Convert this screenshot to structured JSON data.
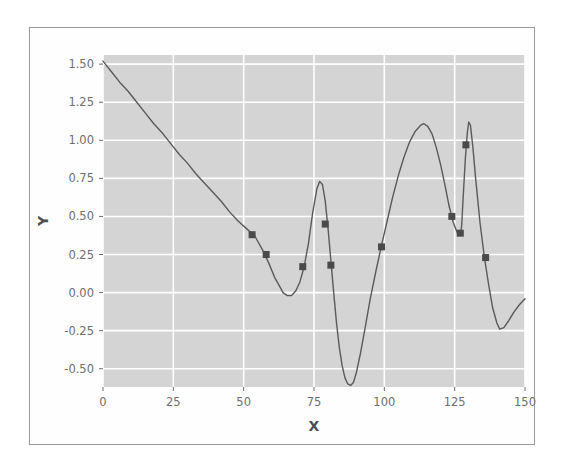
{
  "figure": {
    "background_color": "#ffffff",
    "frame_color": "#9a9a9a",
    "plot_background_color": "#d4d4d4",
    "grid_color": "#ffffff",
    "line_color": "#5a5a5a",
    "marker_color": "#4a4a4a",
    "tick_label_color": "#6e6e6e",
    "axis_title_color": "#4d4d4d"
  },
  "chart_data": {
    "type": "line",
    "title": "",
    "xlabel": "X",
    "ylabel": "Y",
    "xlim": [
      0,
      150
    ],
    "ylim": [
      -0.62,
      1.56
    ],
    "grid": true,
    "legend": null,
    "xticks": [
      0,
      25,
      50,
      75,
      100,
      125,
      150
    ],
    "xticklabels": [
      "0",
      "25",
      "50",
      "75",
      "100",
      "125",
      "150"
    ],
    "yticks": [
      -0.5,
      -0.25,
      0.0,
      0.25,
      0.5,
      0.75,
      1.0,
      1.25,
      1.5
    ],
    "yticklabels": [
      "-0.50",
      "-0.25",
      "0.00",
      "0.25",
      "0.50",
      "0.75",
      "1.00",
      "1.25",
      "1.50"
    ],
    "series": [
      {
        "name": "curve",
        "style": "line",
        "color": "#5a5a5a",
        "linewidth": 1.4,
        "x": [
          0,
          3,
          6,
          9,
          12,
          15,
          18,
          21,
          24,
          27,
          30,
          33,
          36,
          39,
          42,
          45,
          48,
          51,
          54,
          57,
          59,
          61,
          62.5,
          64,
          65.5,
          67,
          68.5,
          70,
          71.5,
          73,
          74.5,
          76,
          77,
          78,
          79,
          80,
          81,
          82,
          83,
          84,
          85,
          86,
          87,
          88,
          89,
          90,
          91.5,
          93,
          95,
          97,
          99,
          101,
          103,
          105,
          107,
          109,
          111,
          113,
          114,
          115.5,
          117,
          118.5,
          120,
          121.5,
          123,
          124.5,
          126,
          127,
          127.5,
          128,
          128.8,
          129.5,
          130,
          130.6,
          131.5,
          132.5,
          134,
          135.5,
          137,
          138.5,
          140,
          141,
          142.5,
          144,
          146,
          148,
          150
        ],
        "y": [
          1.52,
          1.45,
          1.38,
          1.32,
          1.25,
          1.18,
          1.11,
          1.05,
          0.98,
          0.91,
          0.85,
          0.78,
          0.72,
          0.66,
          0.6,
          0.53,
          0.47,
          0.42,
          0.37,
          0.27,
          0.19,
          0.1,
          0.05,
          0.0,
          -0.02,
          -0.02,
          0.01,
          0.07,
          0.17,
          0.32,
          0.52,
          0.68,
          0.73,
          0.71,
          0.6,
          0.42,
          0.21,
          0.0,
          -0.2,
          -0.36,
          -0.48,
          -0.56,
          -0.6,
          -0.61,
          -0.59,
          -0.53,
          -0.4,
          -0.25,
          -0.04,
          0.14,
          0.31,
          0.47,
          0.63,
          0.77,
          0.89,
          0.99,
          1.06,
          1.1,
          1.11,
          1.09,
          1.04,
          0.95,
          0.84,
          0.71,
          0.57,
          0.46,
          0.39,
          0.38,
          0.44,
          0.62,
          0.88,
          1.05,
          1.12,
          1.1,
          0.95,
          0.74,
          0.46,
          0.24,
          0.06,
          -0.1,
          -0.2,
          -0.24,
          -0.23,
          -0.19,
          -0.13,
          -0.08,
          -0.04
        ]
      },
      {
        "name": "sample-points",
        "style": "markers",
        "marker": "square",
        "color": "#4a4a4a",
        "size": 7,
        "points": [
          {
            "x": 53,
            "y": 0.38
          },
          {
            "x": 58,
            "y": 0.25
          },
          {
            "x": 71,
            "y": 0.17
          },
          {
            "x": 79,
            "y": 0.45
          },
          {
            "x": 81,
            "y": 0.18
          },
          {
            "x": 99,
            "y": 0.3
          },
          {
            "x": 124,
            "y": 0.5
          },
          {
            "x": 127,
            "y": 0.39
          },
          {
            "x": 129,
            "y": 0.97
          },
          {
            "x": 136,
            "y": 0.23
          }
        ]
      }
    ]
  }
}
